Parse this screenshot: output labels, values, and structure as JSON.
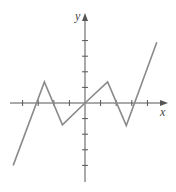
{
  "chart_data": {
    "type": "line",
    "title": "",
    "xlabel": "x",
    "ylabel": "y",
    "grid": false,
    "x_ticks": [
      -4,
      -3,
      -2,
      -1,
      1,
      2,
      3,
      4
    ],
    "y_ticks": [
      -4,
      -3,
      -2,
      -1,
      1,
      2,
      3,
      4
    ],
    "tick_labels_shown": false,
    "xlim": [
      -5.5,
      5.7
    ],
    "ylim": [
      -5.5,
      5.6
    ],
    "series": [
      {
        "name": "piecewise-linear function",
        "points": [
          [
            -4.6,
            -4.0
          ],
          [
            -2.6,
            1.35
          ],
          [
            -1.45,
            -1.4
          ],
          [
            0,
            0
          ],
          [
            1.45,
            1.35
          ],
          [
            2.65,
            -1.45
          ],
          [
            4.6,
            3.9
          ]
        ],
        "color": "#808080"
      }
    ]
  },
  "labels": {
    "x_axis": "x",
    "y_axis": "y"
  },
  "colors": {
    "axis": "#555555",
    "curve": "#8a8a8a"
  }
}
